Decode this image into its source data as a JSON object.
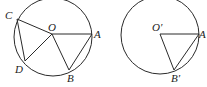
{
  "diagram": {
    "left": {
      "labels": {
        "C": "C",
        "O": "O",
        "A": "A",
        "D": "D",
        "B": "B"
      },
      "center": [
        52,
        35
      ],
      "radius": 39
    },
    "right": {
      "labels": {
        "O": "O′",
        "A": "A",
        "B": "B′"
      },
      "center": [
        160,
        34
      ],
      "radius": 39
    },
    "stroke_color": "#2a2a2a"
  }
}
